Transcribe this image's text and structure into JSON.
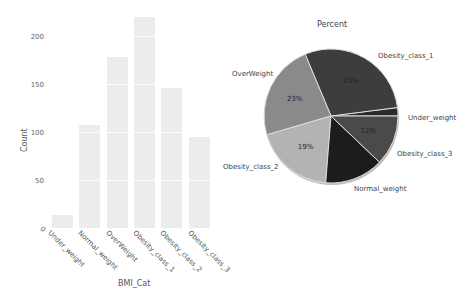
{
  "chart_data": [
    {
      "type": "bar",
      "title": "",
      "xlabel": "BMI_Cat",
      "ylabel": "Count",
      "categories": [
        "Under_weight",
        "Normal_weight",
        "OverWeight",
        "Obesity_class_1",
        "Obesity_class_2",
        "Obesity_class_3"
      ],
      "values": [
        14,
        107,
        178,
        220,
        146,
        95
      ],
      "yticks": [
        "0",
        "50",
        "100",
        "150",
        "200"
      ],
      "ylim": [
        0,
        230
      ],
      "grid": true,
      "bar_color": "#ececec"
    },
    {
      "type": "pie",
      "title": "Percent",
      "labels": [
        "Under_weight",
        "Obesity_class_1",
        "OverWeight",
        "Obesity_class_2",
        "Normal_weight",
        "Obesity_class_3"
      ],
      "values": [
        2,
        29,
        23,
        19,
        14,
        12
      ],
      "pct_labels": [
        "2%",
        "29%",
        "23%",
        "19%",
        "14%",
        "12%"
      ],
      "colors": [
        "#2b2b2b",
        "#3d3d3d",
        "#8a8a8a",
        "#b3b3b3",
        "#1c1c1c",
        "#4a4a4a"
      ],
      "start_angle_deg": 0,
      "direction": "counterclockwise"
    }
  ],
  "bar_chart": {
    "ylabel": "Count",
    "xlabel": "BMI_Cat",
    "ytick_labels": {
      "t0": "0",
      "t50": "50",
      "t100": "100",
      "t150": "150",
      "t200": "200"
    },
    "xtick_labels": [
      "Under_weight",
      "Normal_weight",
      "OverWeight",
      "Obesity_class_1",
      "Obesity_class_2",
      "Obesity_class_3"
    ]
  },
  "pie_chart": {
    "title": "Percent",
    "labels": {
      "obesity_class_1": "Obesity_class_1",
      "overweight": "OverWeight",
      "under_weight": "Under_weight",
      "obesity_class_2": "Obesity_class_2",
      "obesity_class_3": "Obesity_class_3",
      "normal_weight": "Normal_weight"
    }
  }
}
